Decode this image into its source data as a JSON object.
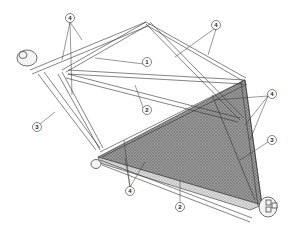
{
  "diagram": {
    "type": "technical-illustration",
    "colors": {
      "background": "#ffffff",
      "line": "#333333",
      "tube_fill": "#f4f4f4",
      "mesh_dark": "#8a8a8a",
      "mesh_light": "#cfcfcf"
    },
    "callouts": [
      {
        "id": "c1",
        "label": "4",
        "x": 70,
        "y": 18
      },
      {
        "id": "c2",
        "label": "4",
        "x": 216,
        "y": 25
      },
      {
        "id": "c3",
        "label": "1",
        "x": 147,
        "y": 62
      },
      {
        "id": "c4",
        "label": "2",
        "x": 147,
        "y": 110
      },
      {
        "id": "c5",
        "label": "4",
        "x": 272,
        "y": 94
      },
      {
        "id": "c6",
        "label": "3",
        "x": 272,
        "y": 140
      },
      {
        "id": "c7",
        "label": "3",
        "x": 37,
        "y": 127
      },
      {
        "id": "c8",
        "label": "4",
        "x": 130,
        "y": 191
      },
      {
        "id": "c9",
        "label": "2",
        "x": 180,
        "y": 207
      }
    ]
  }
}
